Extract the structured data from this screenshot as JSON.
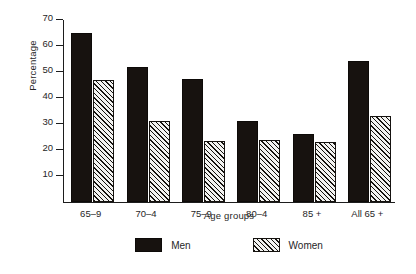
{
  "chart_data": {
    "type": "bar",
    "title": "",
    "xlabel": "Age groups",
    "ylabel": "Percentage",
    "categories": [
      "65–9",
      "70–4",
      "75–9",
      "80–4",
      "85 +",
      "All 65 +"
    ],
    "series": [
      {
        "name": "Men",
        "values": [
          65,
          52,
          47.5,
          31,
          26,
          54.3
        ]
      },
      {
        "name": "Women",
        "values": [
          47,
          31,
          23.5,
          23.7,
          23,
          33
        ]
      }
    ],
    "ylim": [
      0,
      70
    ],
    "yticks": [
      10,
      20,
      30,
      40,
      50,
      60,
      70
    ],
    "ytick_labels": [
      "10",
      "20",
      "30",
      "40",
      "50",
      "60",
      "70"
    ],
    "grid": false,
    "legend_position": "bottom-center",
    "colors": {
      "men": "#17120f",
      "women_fill": "#f3f3f1",
      "women_hatch": "#15120f",
      "axis": "#1d1d1d",
      "text": "#262626",
      "background": "#ffffff"
    }
  }
}
